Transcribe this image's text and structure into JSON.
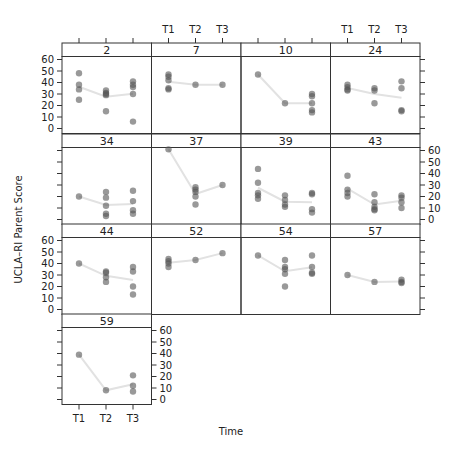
{
  "chart_data": {
    "type": "scatter",
    "title": "",
    "xlabel": "Time",
    "ylabel": "UCLA–RI Parent Score",
    "x_categories": [
      "T1",
      "T2",
      "T3"
    ],
    "ylim": [
      0,
      60
    ],
    "y_ticks": [
      0,
      10,
      20,
      30,
      40,
      50,
      60
    ],
    "grid": false,
    "layout": {
      "columns": 4,
      "rows": 4
    },
    "panels": [
      {
        "label": "2",
        "T1": [
          48,
          38,
          34,
          25
        ],
        "T2": [
          33,
          31,
          30,
          29,
          15
        ],
        "T3": [
          41,
          38,
          36,
          30,
          6
        ]
      },
      {
        "label": "7",
        "T1": [
          47,
          45,
          42,
          35,
          34
        ],
        "T2": [
          38
        ],
        "T3": [
          38
        ]
      },
      {
        "label": "10",
        "T1": [
          47
        ],
        "T2": [
          22
        ],
        "T3": [
          30,
          28,
          22,
          16,
          14
        ]
      },
      {
        "label": "24",
        "T1": [
          38,
          36,
          34,
          33
        ],
        "T2": [
          35,
          33,
          22
        ],
        "T3": [
          41,
          35,
          16,
          15
        ]
      },
      {
        "label": "34",
        "T1": [
          20
        ],
        "T2": [
          24,
          19,
          12,
          5,
          3
        ],
        "T3": [
          25,
          16,
          8,
          5
        ]
      },
      {
        "label": "37",
        "T1": [
          61
        ],
        "T2": [
          28,
          26,
          24,
          20,
          13
        ],
        "T3": [
          30
        ]
      },
      {
        "label": "39",
        "T1": [
          44,
          32,
          23,
          21,
          18
        ],
        "T2": [
          21,
          17,
          13,
          11
        ],
        "T3": [
          23,
          22,
          9,
          6
        ]
      },
      {
        "label": "43",
        "T1": [
          38,
          26,
          23,
          20
        ],
        "T2": [
          22,
          15,
          11,
          9,
          8
        ],
        "T3": [
          21,
          19,
          15,
          10
        ]
      },
      {
        "label": "44",
        "T1": [
          40
        ],
        "T2": [
          33,
          32,
          28,
          24
        ],
        "T3": [
          37,
          33,
          20,
          13
        ]
      },
      {
        "label": "52",
        "T1": [
          44,
          42,
          40,
          37
        ],
        "T2": [
          43
        ],
        "T3": [
          49
        ]
      },
      {
        "label": "54",
        "T1": [
          47
        ],
        "T2": [
          43,
          37,
          35,
          31,
          20
        ],
        "T3": [
          47,
          37,
          32,
          31
        ]
      },
      {
        "label": "57",
        "T1": [
          30
        ],
        "T2": [
          24
        ],
        "T3": [
          26,
          24,
          23
        ]
      },
      {
        "label": "59",
        "T1": [
          39
        ],
        "T2": [
          8
        ],
        "T3": [
          21,
          12,
          7
        ]
      }
    ]
  },
  "axes": {
    "x_title": "Time",
    "y_title": "UCLA–RI Parent Score"
  }
}
